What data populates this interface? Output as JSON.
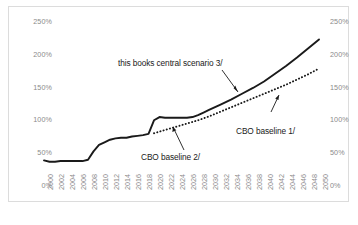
{
  "chart_data": {
    "type": "line",
    "title": "",
    "subtitle": "",
    "xlabel": "",
    "ylabel": "",
    "xlim": [
      2000,
      2050
    ],
    "ylim": [
      0,
      250
    ],
    "grid": false,
    "legend_position": "inline-annotations",
    "y_axis_unit": "%",
    "dual_y_axis": true,
    "y_ticks": [
      0,
      50,
      100,
      150,
      200,
      250
    ],
    "y_tick_labels": [
      "0%",
      "50%",
      "100%",
      "150%",
      "200%",
      "250%"
    ],
    "x_ticks": [
      2000,
      2002,
      2004,
      2006,
      2008,
      2010,
      2012,
      2014,
      2016,
      2018,
      2020,
      2022,
      2024,
      2026,
      2028,
      2030,
      2032,
      2034,
      2036,
      2038,
      2040,
      2042,
      2044,
      2046,
      2048,
      2050
    ],
    "x_tick_labels": [
      "2000",
      "2002",
      "2004",
      "2006",
      "2008",
      "2010",
      "2012",
      "2014",
      "2016",
      "2018",
      "2020",
      "2022",
      "2024",
      "2026",
      "2028",
      "2030",
      "2032",
      "2034",
      "2036",
      "2038",
      "2040",
      "2042",
      "2044",
      "2046",
      "2048",
      "2050"
    ],
    "series": [
      {
        "name": "this books central scenario 3/",
        "style": "solid",
        "color": "#1a1a1a",
        "x": [
          2000,
          2001,
          2002,
          2003,
          2004,
          2005,
          2006,
          2007,
          2008,
          2009,
          2010,
          2011,
          2012,
          2013,
          2014,
          2015,
          2016,
          2017,
          2018,
          2019,
          2020,
          2021,
          2022,
          2023,
          2024,
          2025,
          2026,
          2027,
          2028,
          2029,
          2030,
          2032,
          2034,
          2036,
          2038,
          2040,
          2042,
          2044,
          2046,
          2048,
          2050
        ],
        "values": [
          38,
          36,
          36,
          37,
          37,
          37,
          37,
          37,
          39,
          52,
          62,
          66,
          70,
          72,
          73,
          73,
          75,
          76,
          77,
          79,
          100,
          105,
          104,
          104,
          104,
          104,
          104,
          105,
          108,
          112,
          116,
          124,
          132,
          141,
          150,
          160,
          172,
          184,
          197,
          211,
          225
        ]
      },
      {
        "name": "CBO baseline 1/",
        "style": "dotted",
        "color": "#1a1a1a",
        "x": [
          2020,
          2022,
          2024,
          2026,
          2028,
          2030,
          2032,
          2034,
          2036,
          2038,
          2040,
          2042,
          2044,
          2046,
          2048,
          2050
        ],
        "values": [
          80,
          85,
          90,
          95,
          100,
          106,
          113,
          120,
          127,
          134,
          141,
          148,
          155,
          163,
          171,
          180
        ]
      }
    ],
    "annotations": [
      {
        "id": "central-scenario",
        "text": "this books central scenario 3/",
        "points_to_series": "this books central scenario 3/"
      },
      {
        "id": "cbo-baseline-1",
        "text": "CBO baseline 1/",
        "points_to_series": "CBO baseline 1/"
      },
      {
        "id": "cbo-baseline-2",
        "text": "CBO baseline 2/",
        "points_to_series": "CBO baseline 1/"
      }
    ]
  },
  "axes": {
    "left_labels": [
      "250%",
      "200%",
      "150%",
      "100%",
      "50%",
      "0%"
    ],
    "right_labels": [
      "250%",
      "200%",
      "150%",
      "100%",
      "50%",
      "0%"
    ]
  },
  "annotations": {
    "central_scenario": "this books central scenario 3/",
    "cbo_baseline_1": "CBO baseline 1/",
    "cbo_baseline_2": "CBO baseline 2/"
  },
  "colors": {
    "line": "#1a1a1a",
    "tick_text": "#8a8a8a",
    "frame": "#dcdcdc",
    "annotation_text": "#1a1a1a"
  }
}
